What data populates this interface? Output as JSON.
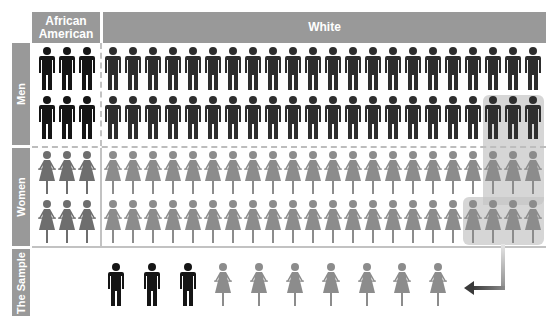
{
  "header": {
    "columns": [
      {
        "label": "African American"
      },
      {
        "label": "White"
      }
    ]
  },
  "rows": {
    "men": {
      "label": "Men"
    },
    "women": {
      "label": "Women"
    },
    "sample": {
      "label": "The Sample"
    }
  },
  "colors": {
    "header_bg": "#999999",
    "aa_man": "#151515",
    "white_man": "#2e2e2e",
    "aa_woman": "#6e6e6e",
    "white_woman": "#8c8c8c",
    "highlight": "#c4c4c4",
    "arrow_dark": "#555555"
  },
  "population": {
    "african_american_per_row": 3,
    "white_per_row": 22,
    "rows_per_group": 2,
    "men_total": 50,
    "women_total": 50
  },
  "sample": {
    "icons": [
      "man-aa",
      "man-aa",
      "man-aa",
      "woman",
      "woman",
      "woman",
      "woman",
      "woman",
      "woman",
      "woman"
    ],
    "men_count": 3,
    "women_count": 7,
    "total": 10
  },
  "highlighted": {
    "men_row2_last": 3,
    "women_row1_last": 3,
    "women_row2_last": 4
  }
}
